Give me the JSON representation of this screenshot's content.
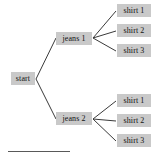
{
  "diagram": {
    "type": "tree-diagram",
    "title_visible": false,
    "background_color": "#ffffff",
    "node_fill_color": "#c9c9c9",
    "node_text_color": "#111111",
    "edge_color": "#3a3a3a",
    "rule_color": "#595959",
    "root": {
      "id": "start",
      "label": "start",
      "x": 11,
      "y": 72,
      "w": 24,
      "h": 13
    },
    "branches": [
      {
        "id": "jeans-1",
        "label": "jeans 1",
        "x": 56,
        "y": 32,
        "w": 36,
        "h": 13,
        "leaves": [
          {
            "id": "jeans-1-shirt-1",
            "label": "shirt 1",
            "x": 117,
            "y": 4,
            "w": 34,
            "h": 13
          },
          {
            "id": "jeans-1-shirt-2",
            "label": "shirt 2",
            "x": 117,
            "y": 24,
            "w": 34,
            "h": 13
          },
          {
            "id": "jeans-1-shirt-3",
            "label": "shirt 3",
            "x": 117,
            "y": 44,
            "w": 34,
            "h": 13
          }
        ]
      },
      {
        "id": "jeans-2",
        "label": "jeans 2",
        "x": 56,
        "y": 112,
        "w": 36,
        "h": 13,
        "leaves": [
          {
            "id": "jeans-2-shirt-1",
            "label": "shirt 1",
            "x": 117,
            "y": 94,
            "w": 34,
            "h": 13
          },
          {
            "id": "jeans-2-shirt-2",
            "label": "shirt 2",
            "x": 117,
            "y": 114,
            "w": 34,
            "h": 13
          },
          {
            "id": "jeans-2-shirt-3",
            "label": "shirt 3",
            "x": 117,
            "y": 134,
            "w": 34,
            "h": 13
          }
        ]
      }
    ],
    "edges": [
      {
        "from": "start",
        "to": "jeans-1",
        "x1": 36,
        "y1": 79,
        "x2": 56,
        "y2": 38
      },
      {
        "from": "start",
        "to": "jeans-2",
        "x1": 36,
        "y1": 79,
        "x2": 56,
        "y2": 119
      },
      {
        "from": "jeans-1",
        "to": "jeans-1-shirt-1",
        "x1": 93,
        "y1": 38,
        "x2": 116,
        "y2": 11
      },
      {
        "from": "jeans-1",
        "to": "jeans-1-shirt-2",
        "x1": 93,
        "y1": 38,
        "x2": 116,
        "y2": 31
      },
      {
        "from": "jeans-1",
        "to": "jeans-1-shirt-3",
        "x1": 93,
        "y1": 38,
        "x2": 116,
        "y2": 51
      },
      {
        "from": "jeans-2",
        "to": "jeans-2-shirt-1",
        "x1": 93,
        "y1": 119,
        "x2": 116,
        "y2": 101
      },
      {
        "from": "jeans-2",
        "to": "jeans-2-shirt-2",
        "x1": 93,
        "y1": 119,
        "x2": 116,
        "y2": 121
      },
      {
        "from": "jeans-2",
        "to": "jeans-2-shirt-3",
        "x1": 93,
        "y1": 119,
        "x2": 116,
        "y2": 141
      }
    ],
    "footer_rule": {
      "x": 8,
      "y": 151,
      "w": 62,
      "h": 1
    }
  }
}
